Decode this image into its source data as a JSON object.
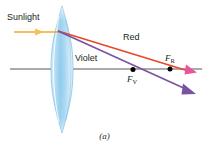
{
  "figure": {
    "caption": "(a)",
    "labels": {
      "sunlight": "Sunlight",
      "red": "Red",
      "violet": "Violet",
      "focal_red": "F",
      "focal_red_sub": "R",
      "focal_violet": "F",
      "focal_violet_sub": "V"
    },
    "colors": {
      "sunlight_ray": "#f2a929",
      "red_ray": "#e8472a",
      "violet_ray": "#7b52a1",
      "red_arrowhead": "#e8559c",
      "violet_arrowhead": "#7b52a1",
      "axis": "#58595b",
      "lens_fill": "#a9d5ef",
      "lens_edge": "#7cbfe4",
      "text": "#231f20",
      "focal_point": "#000000",
      "background": "#ffffff"
    },
    "geometry": {
      "axis_y": 69,
      "axis_x_start": 10,
      "axis_x_end": 202,
      "lens_center_x": 62,
      "lens_top_y": 6,
      "lens_bottom_y": 133,
      "lens_half_width": 11,
      "ray_origin_x": 58,
      "ray_origin_y": 31,
      "sunlight_start_x": 14,
      "sunlight_y": 32,
      "focal_red_point_x": 170,
      "focal_red_point_y": 69,
      "focal_violet_point_x": 133,
      "focal_violet_point_y": 70,
      "red_ray_end_x": 196,
      "red_ray_end_y": 75,
      "violet_ray_end_x": 196,
      "violet_ray_end_y": 95
    }
  }
}
